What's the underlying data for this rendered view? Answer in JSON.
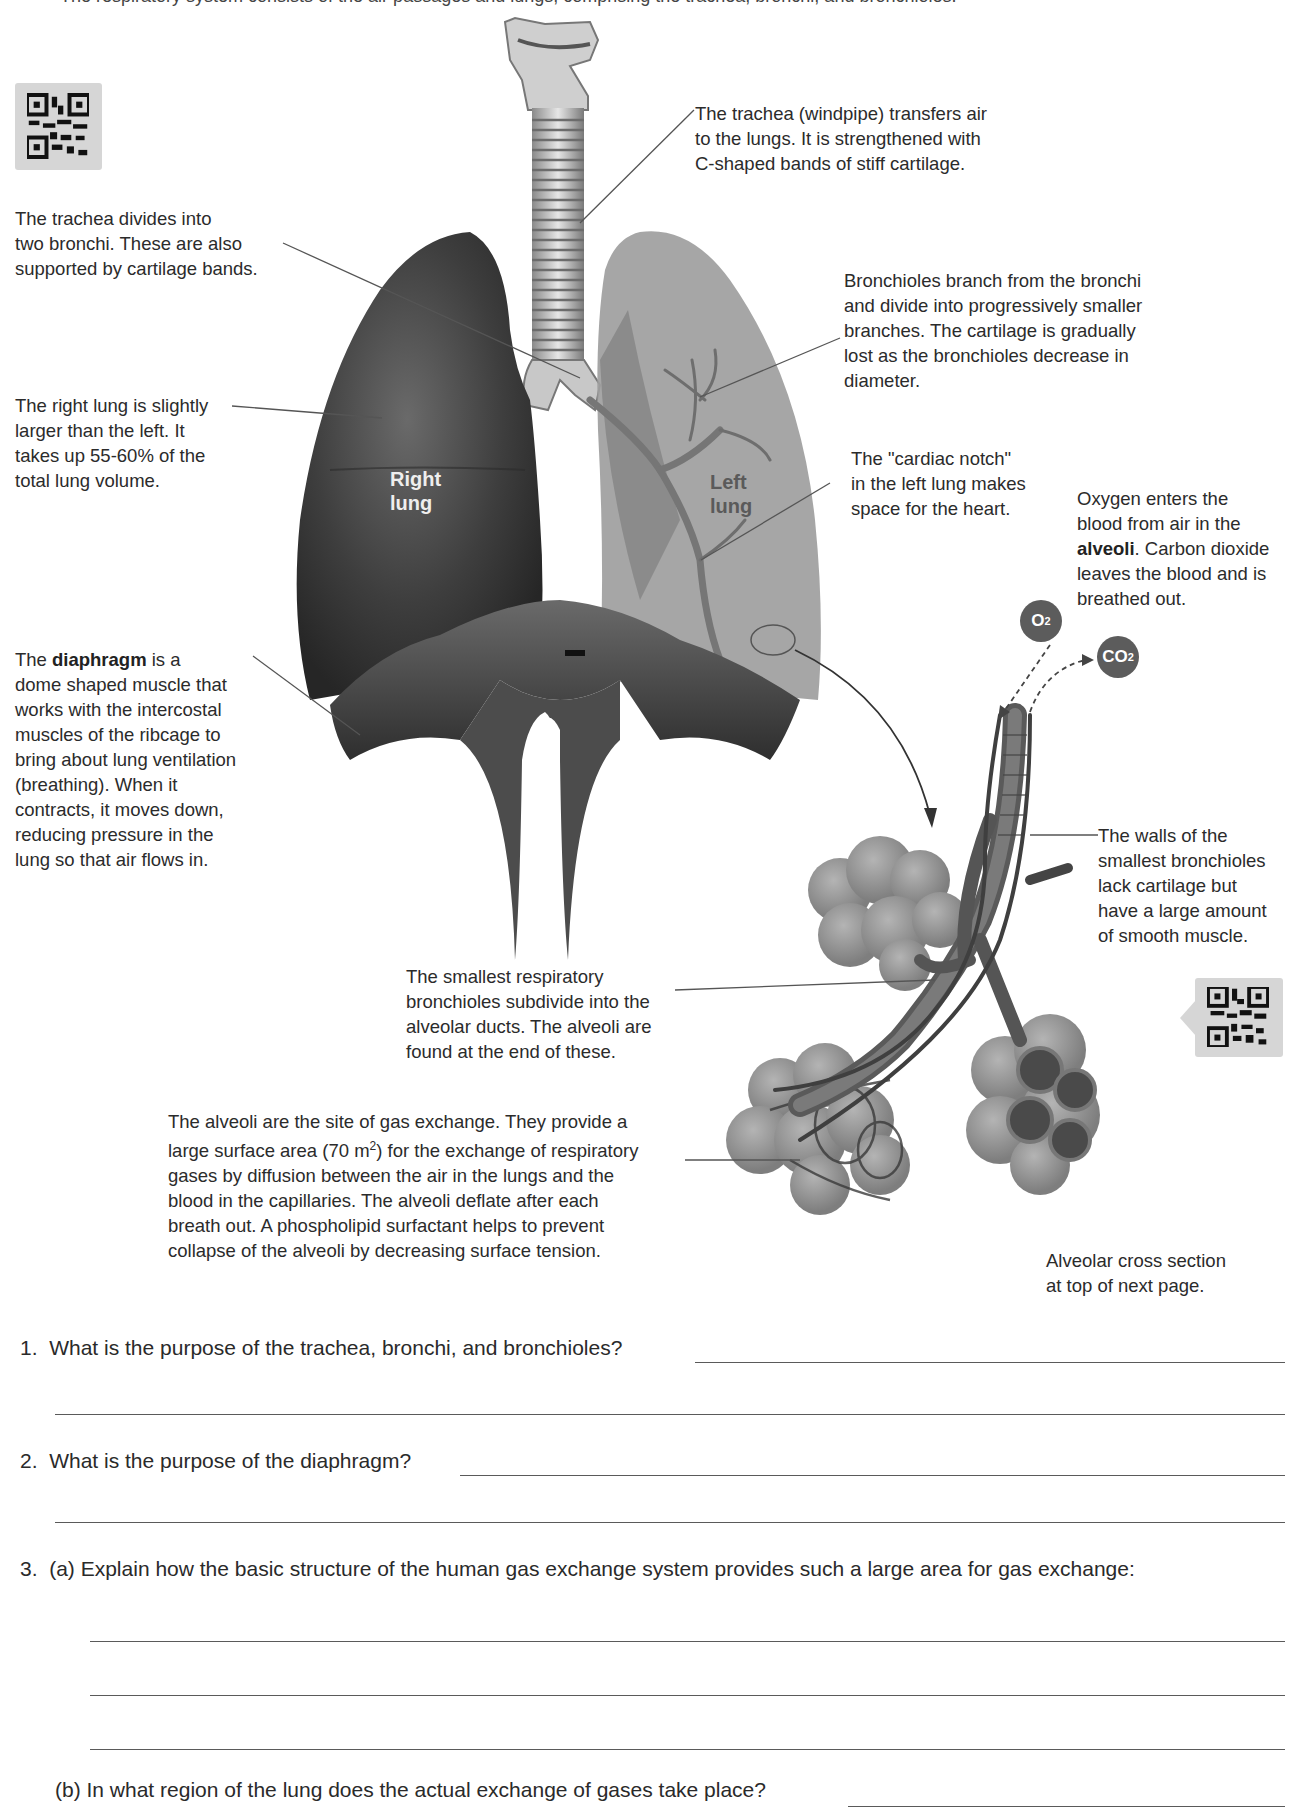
{
  "header": {
    "cut_off_text": "The respiratory system consists of the air passages and lungs, comprising the trachea, bronchi, and bronchioles."
  },
  "diagram": {
    "labels": {
      "right_lung": [
        "Right",
        "lung"
      ],
      "left_lung": [
        "Left",
        "lung"
      ],
      "o2": "O",
      "o2_sub": "2",
      "co2": "CO",
      "co2_sub": "2"
    },
    "captions": {
      "trachea": [
        "The trachea (windpipe) transfers air",
        "to the lungs. It is strengthened with",
        "C-shaped bands of stiff cartilage."
      ],
      "bronchi": [
        "The trachea divides into",
        "two bronchi. These are also",
        "supported by cartilage bands."
      ],
      "bronchioles": [
        "Bronchioles branch from the bronchi",
        "and divide into progressively smaller",
        "branches. The cartilage is gradually",
        "lost as the bronchioles decrease in",
        "diameter."
      ],
      "right_lung": [
        "The right lung is slightly",
        "larger than the left. It",
        "takes up 55-60% of the",
        "total lung volume."
      ],
      "cardiac_notch": [
        "The \"cardiac notch\"",
        "in the left lung makes",
        "space for the heart."
      ],
      "oxygen": {
        "line1": "Oxygen enters the",
        "line2": "blood from air in the",
        "bold": "alveoli",
        "line3_rest": ". Carbon dioxide",
        "line4": "leaves the blood and is",
        "line5": "breathed out."
      },
      "diaphragm": {
        "pre": "The ",
        "bold": "diaphragm",
        "post": " is a",
        "lines": [
          "dome shaped muscle that",
          "works with the intercostal",
          "muscles of the ribcage to",
          "bring about lung ventilation",
          "(breathing). When it",
          "contracts, it moves down,",
          "reducing pressure in the",
          "lung so that air flows in."
        ]
      },
      "smallest_bronchioles_walls": [
        "The walls of the",
        "smallest bronchioles",
        "lack cartilage but",
        "have a large amount",
        "of smooth muscle."
      ],
      "respiratory_bronchioles": [
        "The smallest respiratory",
        "bronchioles subdivide into the",
        "alveolar ducts. The alveoli are",
        "found at the end of these."
      ],
      "alveoli": {
        "line1": "The alveoli are the site of gas exchange. They provide a",
        "line2_pre": "large surface area (70 m",
        "line2_sup": "2",
        "line2_post": ") for the exchange of respiratory",
        "line3": "gases by diffusion between the air in the lungs and the",
        "line4": "blood in the capillaries. The alveoli deflate after each",
        "line5": "breath out. A phospholipid surfactant helps to prevent",
        "line6": "collapse of the alveoli by decreasing surface tension."
      },
      "cross_section_note": [
        "Alveolar cross section",
        "at top of next page."
      ]
    }
  },
  "questions": [
    {
      "number": "1.",
      "text": "What is the purpose of the trachea, bronchi, and bronchioles?"
    },
    {
      "number": "2.",
      "text": "What is the purpose of the diaphragm?"
    },
    {
      "number": "3.",
      "part_a": "(a) Explain how the basic structure of the human gas exchange system provides such a large area for gas exchange:",
      "part_b": "(b) In what region of the lung does the actual exchange of gases take place?"
    }
  ],
  "colors": {
    "right_lung": "#3e3e3e",
    "left_lung": "#9a9a9a",
    "diaphragm": "#4a4a4a",
    "qr_bg": "#d6d6d6",
    "gas_bubble": "#5c5c5c",
    "alveoli": "#8c8c8c"
  }
}
